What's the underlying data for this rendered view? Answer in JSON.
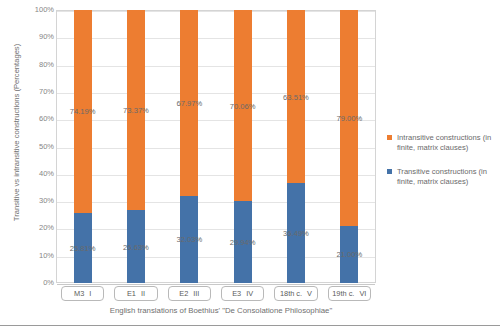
{
  "chart_data": {
    "type": "bar",
    "subtype": "stacked-100-percent",
    "title": "",
    "xlabel": "English translations of Boethius' \"De Consolatione Philosophiae\"",
    "ylabel": "Transitive vs intransitive constructions (Percentages)",
    "ylim": [
      0,
      100
    ],
    "grid": true,
    "legend_position": "right",
    "categories": [
      "M3",
      "E1",
      "E2",
      "E3",
      "18th c.",
      "19th c."
    ],
    "category_numerals": [
      "I",
      "II",
      "III",
      "IV",
      "V",
      "VI"
    ],
    "ytick_labels": [
      "0%",
      "10%",
      "20%",
      "30%",
      "40%",
      "50%",
      "60%",
      "70%",
      "80%",
      "90%",
      "100%"
    ],
    "ytick_values": [
      0,
      10,
      20,
      30,
      40,
      50,
      60,
      70,
      80,
      90,
      100
    ],
    "series": [
      {
        "name": "Intransitive constructions (in finite, matrix clauses)",
        "color": "#ED7D31",
        "values": [
          74.19,
          73.37,
          67.97,
          70.06,
          63.51,
          79.0
        ],
        "labels": [
          "74.19%",
          "73.37%",
          "67.97%",
          "70.06%",
          "63.51%",
          "79.00%"
        ]
      },
      {
        "name": "Transitive constructions (in finite, matrix clauses)",
        "color": "#4472A8",
        "values": [
          25.81,
          26.63,
          32.03,
          29.94,
          36.49,
          21.0
        ],
        "labels": [
          "25.81%",
          "26.63%",
          "32.03%",
          "29.94%",
          "36.49%",
          "21.00%"
        ]
      }
    ]
  },
  "legend": {
    "entries": [
      {
        "label": "Intransitive constructions (in finite, matrix clauses)",
        "color": "#ED7D31"
      },
      {
        "label": "Transitive constructions (in finite, matrix clauses)",
        "color": "#4472A8"
      }
    ]
  }
}
